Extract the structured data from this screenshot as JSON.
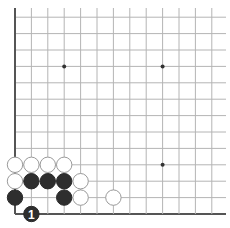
{
  "board": {
    "size_visible_cols": 13,
    "size_visible_rows": 13,
    "origin_x": 15,
    "origin_y": 214,
    "spacing": 16.4,
    "colors": {
      "black": "#2e2e2e",
      "white": "#ffffff",
      "grid": "#b4b4b4",
      "edge": "#555555"
    },
    "edges": [
      "left",
      "bottom"
    ],
    "star_points": [
      {
        "col": 3,
        "row": 9
      },
      {
        "col": 9,
        "row": 9
      },
      {
        "col": 9,
        "row": 3
      }
    ],
    "stones": [
      {
        "color": "white",
        "col": 0,
        "row": 3
      },
      {
        "color": "white",
        "col": 1,
        "row": 3
      },
      {
        "color": "white",
        "col": 2,
        "row": 3
      },
      {
        "color": "white",
        "col": 3,
        "row": 3
      },
      {
        "color": "white",
        "col": 0,
        "row": 2
      },
      {
        "color": "black",
        "col": 1,
        "row": 2
      },
      {
        "color": "black",
        "col": 2,
        "row": 2
      },
      {
        "color": "black",
        "col": 3,
        "row": 2
      },
      {
        "color": "white",
        "col": 4,
        "row": 2
      },
      {
        "color": "black",
        "col": 0,
        "row": 1
      },
      {
        "color": "black",
        "col": 3,
        "row": 1
      },
      {
        "color": "white",
        "col": 4,
        "row": 1
      },
      {
        "color": "white",
        "col": 6,
        "row": 1
      },
      {
        "color": "black",
        "col": 1,
        "row": 0,
        "label": "1"
      }
    ]
  }
}
